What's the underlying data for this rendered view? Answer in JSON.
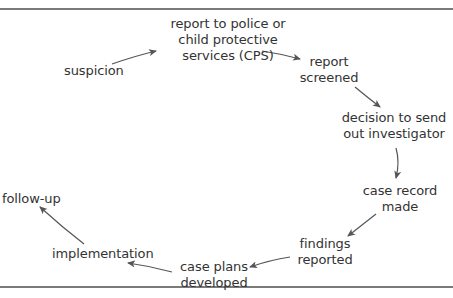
{
  "diagram": {
    "type": "cycle",
    "colors": {
      "text": "#333333",
      "arrow": "#555555",
      "rule": "#7a7a7a"
    },
    "nodes": [
      {
        "id": "suspicion",
        "lines": [
          "suspicion"
        ]
      },
      {
        "id": "report",
        "lines": [
          "report to police or",
          "child protective",
          "services (CPS)"
        ]
      },
      {
        "id": "screened",
        "lines": [
          "report",
          "screened"
        ]
      },
      {
        "id": "decision",
        "lines": [
          "decision to send",
          "out investigator"
        ]
      },
      {
        "id": "record",
        "lines": [
          "case record",
          "made"
        ]
      },
      {
        "id": "findings",
        "lines": [
          "findings",
          "reported"
        ]
      },
      {
        "id": "plans",
        "lines": [
          "case plans",
          "developed"
        ]
      },
      {
        "id": "implementation",
        "lines": [
          "implementation"
        ]
      },
      {
        "id": "followup",
        "lines": [
          "follow-up"
        ]
      }
    ],
    "edges": [
      {
        "from": "suspicion",
        "to": "report"
      },
      {
        "from": "report",
        "to": "screened"
      },
      {
        "from": "screened",
        "to": "decision"
      },
      {
        "from": "decision",
        "to": "record"
      },
      {
        "from": "record",
        "to": "findings"
      },
      {
        "from": "findings",
        "to": "plans"
      },
      {
        "from": "plans",
        "to": "implementation"
      },
      {
        "from": "implementation",
        "to": "followup"
      }
    ]
  }
}
